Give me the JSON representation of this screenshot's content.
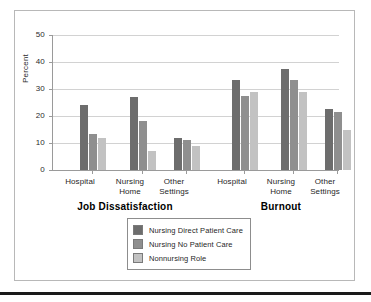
{
  "chart_data": {
    "type": "bar",
    "title": "",
    "xlabel": "",
    "ylabel": "Percent",
    "ylim": [
      0,
      50
    ],
    "yticks": [
      0,
      10,
      20,
      30,
      40,
      50
    ],
    "grid": true,
    "legend_position": "bottom-center",
    "sections": [
      {
        "name": "Job Dissatisfaction",
        "categories": [
          "Hospital",
          "Nursing Home",
          "Other Settings"
        ],
        "series": [
          {
            "name": "Nursing Direct Patient Care",
            "values": [
              24,
              27,
              12
            ]
          },
          {
            "name": "Nursing No Patient Care",
            "values": [
              13.5,
              18,
              11
            ]
          },
          {
            "name": "Nonnursing Role",
            "values": [
              12,
              7,
              9
            ]
          }
        ]
      },
      {
        "name": "Burnout",
        "categories": [
          "Hospital",
          "Nursing Home",
          "Other Settings"
        ],
        "series": [
          {
            "name": "Nursing Direct Patient Care",
            "values": [
              33.5,
              37.5,
              22.5
            ]
          },
          {
            "name": "Nursing No Patient Care",
            "values": [
              27.5,
              33.5,
              21.5
            ]
          },
          {
            "name": "Nonnursing Role",
            "values": [
              29,
              29,
              15
            ]
          }
        ]
      }
    ],
    "series_colors": [
      "#6d6d6d",
      "#8f8f8f",
      "#c2c2c2"
    ],
    "legend": [
      {
        "label": "Nursing Direct Patient Care",
        "color": "#6d6d6d"
      },
      {
        "label": "Nursing No Patient Care",
        "color": "#8f8f8f"
      },
      {
        "label": "Nonnursing Role",
        "color": "#c2c2c2"
      }
    ]
  },
  "axis": {
    "y_label": "Percent",
    "y_tick_labels": [
      "50",
      "40",
      "30",
      "20",
      "10",
      "0"
    ]
  },
  "categories": {
    "jd_hospital": "Hospital",
    "jd_nursing_line1": "Nursing",
    "jd_nursing_line2": "Home",
    "jd_other_line1": "Other",
    "jd_other_line2": "Settings",
    "bo_hospital": "Hospital",
    "bo_nursing_line1": "Nursing",
    "bo_nursing_line2": "Home",
    "bo_other_line1": "Other",
    "bo_other_line2": "Settings"
  },
  "sections": {
    "job_dissatisfaction": "Job Dissatisfaction",
    "burnout": "Burnout"
  },
  "legend": {
    "item0": "Nursing Direct Patient Care",
    "item1": "Nursing No Patient Care",
    "item2": "Nonnursing Role"
  }
}
